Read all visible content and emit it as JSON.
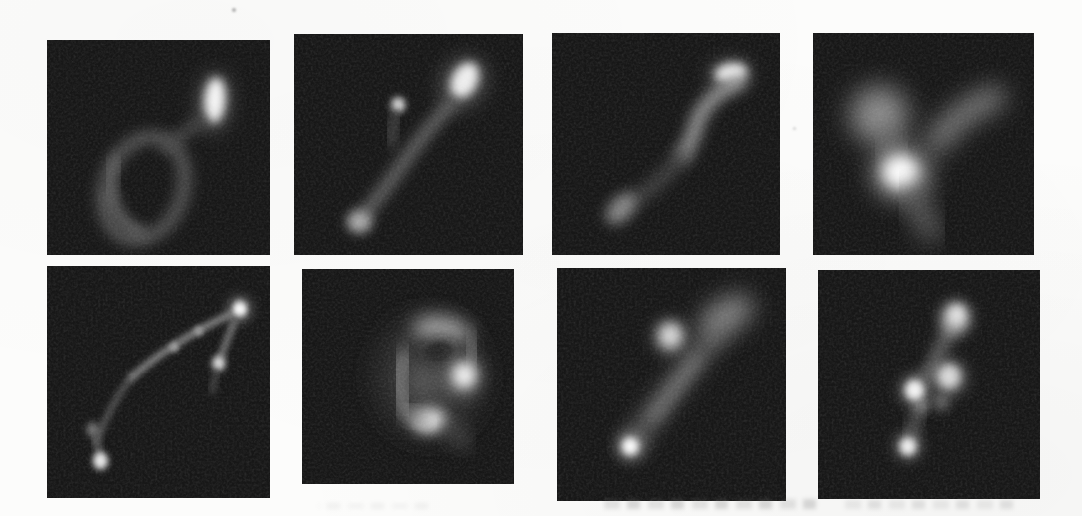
{
  "page": {
    "background": "#fcfcfb",
    "tile_background": "#171717"
  },
  "figure": {
    "name": "fluorescence-micrograph-grid",
    "rows": 2,
    "columns": 4,
    "tiles": [
      {
        "name": "micrograph-r1c1",
        "desc": "dim open loop lower left with bright vertical spot at upper right",
        "shapes": [
          {
            "kind": "blob",
            "cx": 75,
            "cy": 29,
            "rx": 7,
            "ry": 14,
            "rot": 4,
            "fill": "#7d7d7d",
            "blur": 4.5,
            "opacity": 0.6
          },
          {
            "kind": "blob",
            "cx": 75.3,
            "cy": 28,
            "rx": 4.6,
            "ry": 10.5,
            "rot": 4,
            "fill": "#f4f4f4",
            "blur": 2.2
          },
          {
            "kind": "ring",
            "cx": 43.5,
            "cy": 69,
            "rx": 17.5,
            "ry": 24.5,
            "rot": 18,
            "stroke": "#595959",
            "w": 5.5,
            "blur": 3
          },
          {
            "kind": "stroke",
            "d": "M 29,72 C 30,80 35,87 42,89",
            "stroke": "#6e6e6e",
            "w": 5,
            "blur": 2.8,
            "opacity": 0.9
          },
          {
            "kind": "stroke",
            "d": "M 31,56 C 29,61 28,66 28.5,71",
            "stroke": "#676767",
            "w": 5,
            "blur": 2.8,
            "opacity": 0.85
          },
          {
            "kind": "stroke",
            "d": "M 53,50 C 58,46 63,42 69.5,37.5",
            "stroke": "#4e4e4e",
            "w": 4.5,
            "blur": 3
          }
        ]
      },
      {
        "name": "micrograph-r1c2",
        "desc": "forked filament with bright blob top right, small dot upper middle, dim blob bottom left",
        "shapes": [
          {
            "kind": "blob",
            "cx": 74,
            "cy": 22,
            "rx": 9.5,
            "ry": 12,
            "rot": 25,
            "fill": "#757575",
            "blur": 4.5,
            "opacity": 0.6
          },
          {
            "kind": "blob",
            "cx": 74.5,
            "cy": 21,
            "rx": 5.5,
            "ry": 8.5,
            "rot": 25,
            "fill": "#ededed",
            "blur": 2.2
          },
          {
            "kind": "stroke",
            "d": "M 69,31 C 61,40 54,49 48,58 C 43,65.5 36.5,74.5 30,82.5",
            "stroke": "#6c6c6c",
            "w": 5,
            "blur": 3
          },
          {
            "kind": "blob",
            "cx": 45.5,
            "cy": 32,
            "rx": 3,
            "ry": 3.4,
            "fill": "#e2e2e2",
            "blur": 1.6
          },
          {
            "kind": "stroke",
            "d": "M 44.5,36 C 43.5,40.5 42.8,45 42.3,49.5",
            "stroke": "#4e4e4e",
            "w": 3.6,
            "blur": 2.6
          },
          {
            "kind": "blob",
            "cx": 28.5,
            "cy": 85,
            "rx": 5.4,
            "ry": 5,
            "fill": "#ababab",
            "blur": 2.4
          }
        ]
      },
      {
        "name": "micrograph-r1c3",
        "desc": "s-shaped curve with bright tip top right fading to dim blob lower left",
        "shapes": [
          {
            "kind": "blob",
            "cx": 78,
            "cy": 18.5,
            "rx": 9.5,
            "ry": 6.5,
            "rot": -10,
            "fill": "#7a7a7a",
            "blur": 4,
            "opacity": 0.6
          },
          {
            "kind": "blob",
            "cx": 78.5,
            "cy": 18,
            "rx": 7,
            "ry": 4.3,
            "rot": -10,
            "fill": "#efefef",
            "blur": 2.2
          },
          {
            "kind": "stroke",
            "d": "M 82,22 C 73,26 67,32 64,39 C 62.5,45 60.5,50 57.5,55",
            "stroke": "#979797",
            "w": 6.2,
            "blur": 3
          },
          {
            "kind": "stroke",
            "d": "M 57.5,55 C 52,62 45,69 38,74",
            "stroke": "#4b4b4b",
            "w": 5.2,
            "blur": 3.4
          },
          {
            "kind": "blob",
            "cx": 30.5,
            "cy": 79,
            "rx": 5,
            "ry": 8.5,
            "rot": 42,
            "fill": "#878787",
            "blur": 2.8
          }
        ]
      },
      {
        "name": "micrograph-r1c4",
        "desc": "large blurry crossing limbs with bright core left of center",
        "shapes": [
          {
            "kind": "blob",
            "cx": 30,
            "cy": 37,
            "rx": 13,
            "ry": 13,
            "rot": 0,
            "fill": "#8c8c8c",
            "blur": 6
          },
          {
            "kind": "stroke",
            "d": "M 82,29 C 72,33 63,39 56,49",
            "stroke": "#7f7f7f",
            "w": 10,
            "blur": 5.5
          },
          {
            "kind": "stroke",
            "d": "M 32.5,46 C 34.5,50.5 36.5,55 38.5,58.5",
            "stroke": "#6d6d6d",
            "w": 8,
            "blur": 5.5,
            "opacity": 0.85
          },
          {
            "kind": "blob",
            "cx": 40,
            "cy": 63,
            "rx": 13,
            "ry": 12,
            "rot": 0,
            "fill": "#969696",
            "blur": 5.5
          },
          {
            "kind": "blob",
            "cx": 39.5,
            "cy": 62.5,
            "rx": 7.5,
            "ry": 7,
            "rot": 0,
            "fill": "#fbfbfb",
            "blur": 3.2
          },
          {
            "kind": "stroke",
            "d": "M 45,73 C 48,79 51,85 53.5,90",
            "stroke": "#696969",
            "w": 8,
            "blur": 5.5
          }
        ]
      },
      {
        "name": "micrograph-r2c1",
        "desc": "thin beaded filament arcing from bright dot bottom left to bright dot top right with short side branch",
        "shapes": [
          {
            "kind": "stroke",
            "d": "M 22,76 C 26,66 31,56 38,48",
            "stroke": "#585858",
            "w": 2.6,
            "blur": 1.5
          },
          {
            "kind": "stroke",
            "d": "M 38,48 C 50,38 66,28 83,20.5",
            "stroke": "#8a8a8a",
            "w": 2.8,
            "blur": 1.4
          },
          {
            "kind": "blob",
            "cx": 57,
            "cy": 35,
            "rx": 2,
            "ry": 2,
            "rot": 0,
            "fill": "#a0a0a0",
            "blur": 1.1
          },
          {
            "kind": "blob",
            "cx": 68,
            "cy": 28,
            "rx": 2,
            "ry": 2,
            "rot": 0,
            "fill": "#9a9a9a",
            "blur": 1.1
          },
          {
            "kind": "blob",
            "cx": 86.5,
            "cy": 18.5,
            "rx": 5.5,
            "ry": 5.5,
            "rot": 0,
            "fill": "#848484",
            "blur": 2.6,
            "opacity": 0.7
          },
          {
            "kind": "blob",
            "cx": 86.5,
            "cy": 18.5,
            "rx": 3.2,
            "ry": 3.2,
            "rot": 0,
            "fill": "#f8f8f8",
            "blur": 1.3
          },
          {
            "kind": "stroke",
            "d": "M 84,24 C 81.5,30 79.5,35 78,39",
            "stroke": "#7a7a7a",
            "w": 2.8,
            "blur": 1.4
          },
          {
            "kind": "blob",
            "cx": 77,
            "cy": 42,
            "rx": 3,
            "ry": 3.3,
            "rot": 0,
            "fill": "#dadada",
            "blur": 1.4
          },
          {
            "kind": "stroke",
            "d": "M 76,46 C 75.2,49 74.5,51.5 74,54",
            "stroke": "#4c4c4c",
            "w": 2.5,
            "blur": 1.7
          },
          {
            "kind": "blob",
            "cx": 20.5,
            "cy": 70.5,
            "rx": 2.7,
            "ry": 3,
            "rot": 0,
            "fill": "#7d7d7d",
            "blur": 1.6
          },
          {
            "kind": "stroke",
            "d": "M 21.5,73.5 C 22.5,77 23.3,80 24,82.5",
            "stroke": "#5c5c5c",
            "w": 2.7,
            "blur": 1.5
          },
          {
            "kind": "blob",
            "cx": 24,
            "cy": 84,
            "rx": 3.4,
            "ry": 3.8,
            "rot": 0,
            "fill": "#e6e6e6",
            "blur": 1.4
          }
        ]
      },
      {
        "name": "micrograph-r2c2",
        "desc": "ring-shaped blob with dark center notch, bright spot right and bright bottom arc",
        "shapes": [
          {
            "kind": "blob",
            "cx": 60,
            "cy": 50,
            "rx": 24,
            "ry": 27,
            "rot": 0,
            "fill": "#353535",
            "blur": 7
          },
          {
            "kind": "blob",
            "cx": 66,
            "cy": 28.5,
            "rx": 13.5,
            "ry": 6.5,
            "rot": 8,
            "fill": "#9b9b9b",
            "blur": 4.2
          },
          {
            "kind": "stroke",
            "d": "M 79,32 C 81,37 81.5,41 80,45",
            "stroke": "#787878",
            "w": 6,
            "blur": 4,
            "opacity": 0.9
          },
          {
            "kind": "blob",
            "cx": 64.5,
            "cy": 38.5,
            "rx": 8,
            "ry": 5.5,
            "rot": -12,
            "fill": "#191919",
            "blur": 3.8
          },
          {
            "kind": "stroke",
            "d": "M 48.5,41 C 45.5,48 45.5,57 48.5,63.5",
            "stroke": "#8d8d8d",
            "w": 7,
            "blur": 4
          },
          {
            "kind": "blob",
            "cx": 58,
            "cy": 52,
            "rx": 8.5,
            "ry": 9,
            "rot": 0,
            "fill": "#565656",
            "blur": 5,
            "opacity": 0.95
          },
          {
            "kind": "blob",
            "cx": 76,
            "cy": 49.5,
            "rx": 8,
            "ry": 9,
            "rot": 0,
            "fill": "#909090",
            "blur": 4.2,
            "opacity": 0.85
          },
          {
            "kind": "blob",
            "cx": 76.5,
            "cy": 49.5,
            "rx": 5,
            "ry": 5.5,
            "rot": 0,
            "fill": "#f1f1f1",
            "blur": 2.8
          },
          {
            "kind": "blob",
            "cx": 60,
            "cy": 70.5,
            "rx": 8,
            "ry": 5.5,
            "rot": -6,
            "fill": "#e7e7e7",
            "blur": 3
          },
          {
            "kind": "stroke",
            "d": "M 69,73 C 72.5,76 75,79 76.5,81.5",
            "stroke": "#565656",
            "w": 6,
            "blur": 4.5,
            "opacity": 0.85
          },
          {
            "kind": "stroke",
            "d": "M 50,66 C 52.5,69 55.5,70.5 58,71",
            "stroke": "#8a8a8a",
            "w": 6,
            "blur": 3.5,
            "opacity": 0.9
          }
        ]
      },
      {
        "name": "micrograph-r2c3",
        "desc": "diffuse diagonal streak from bright dot bottom left to diffuse blob top right with bright knob upper middle",
        "shapes": [
          {
            "kind": "stroke",
            "d": "M 33,75 C 41,64 50,52 59,41 C 63,36 67,31 70,28",
            "stroke": "#5e5e5e",
            "w": 8.5,
            "blur": 4.5
          },
          {
            "kind": "blob",
            "cx": 74,
            "cy": 20.5,
            "rx": 13,
            "ry": 7,
            "rot": -30,
            "fill": "#848484",
            "blur": 5
          },
          {
            "kind": "stroke",
            "d": "M 42,64 C 49,55 55,47 61,39",
            "stroke": "#757575",
            "w": 4.5,
            "blur": 3,
            "opacity": 0.9
          },
          {
            "kind": "blob",
            "cx": 49.5,
            "cy": 29.5,
            "rx": 7.5,
            "ry": 7.5,
            "rot": 0,
            "fill": "#7e7e7e",
            "blur": 3.5,
            "opacity": 0.8
          },
          {
            "kind": "blob",
            "cx": 49.5,
            "cy": 29,
            "rx": 4.8,
            "ry": 5,
            "rot": 0,
            "fill": "#d6d6d6",
            "blur": 2.4
          },
          {
            "kind": "blob",
            "cx": 32,
            "cy": 76.5,
            "rx": 6,
            "ry": 6,
            "rot": 0,
            "fill": "#8a8a8a",
            "blur": 3,
            "opacity": 0.8
          },
          {
            "kind": "blob",
            "cx": 32,
            "cy": 76.5,
            "rx": 3.6,
            "ry": 3.8,
            "rot": 0,
            "fill": "#fafafa",
            "blur": 1.6
          }
        ]
      },
      {
        "name": "micrograph-r2c4",
        "desc": "diagonal chain of bright beads from bottom left to top right",
        "shapes": [
          {
            "kind": "stroke",
            "d": "M 61,24 C 58,29 55,34 53,39 C 52,41.5 51.5,43.5 51,45.5",
            "stroke": "#6e6e6e",
            "w": 5,
            "blur": 3
          },
          {
            "kind": "stroke",
            "d": "M 45,50 C 47,47.5 49,45.5 51,44",
            "stroke": "#606060",
            "w": 4.5,
            "blur": 3,
            "opacity": 0.9
          },
          {
            "kind": "stroke",
            "d": "M 41,75 C 42.5,70 44,65.5 45.5,61",
            "stroke": "#636363",
            "w": 4,
            "blur": 2.8
          },
          {
            "kind": "blob",
            "cx": 46.5,
            "cy": 59,
            "rx": 3.4,
            "ry": 3.6,
            "rot": 0,
            "fill": "#7a7a7a",
            "blur": 2.2
          },
          {
            "kind": "blob",
            "cx": 55.5,
            "cy": 57.5,
            "rx": 3.6,
            "ry": 3.8,
            "rot": 0,
            "fill": "#6f6f6f",
            "blur": 2.5
          },
          {
            "kind": "blob",
            "cx": 40.5,
            "cy": 77,
            "rx": 6,
            "ry": 6,
            "rot": 0,
            "fill": "#777777",
            "blur": 3,
            "opacity": 0.8
          },
          {
            "kind": "blob",
            "cx": 40.5,
            "cy": 77,
            "rx": 3.7,
            "ry": 3.9,
            "rot": 0,
            "fill": "#ededed",
            "blur": 1.6
          },
          {
            "kind": "blob",
            "cx": 43.5,
            "cy": 52.5,
            "rx": 6.5,
            "ry": 6.5,
            "rot": 0,
            "fill": "#808080",
            "blur": 3,
            "opacity": 0.85
          },
          {
            "kind": "blob",
            "cx": 43.5,
            "cy": 52.5,
            "rx": 4.2,
            "ry": 4.4,
            "rot": 0,
            "fill": "#f2f2f2",
            "blur": 1.7
          },
          {
            "kind": "blob",
            "cx": 59,
            "cy": 47,
            "rx": 7.5,
            "ry": 7.5,
            "rot": 0,
            "fill": "#7c7c7c",
            "blur": 3.5,
            "opacity": 0.85
          },
          {
            "kind": "blob",
            "cx": 59,
            "cy": 46.5,
            "rx": 5,
            "ry": 5.2,
            "rot": 0,
            "fill": "#d9d9d9",
            "blur": 2.2
          },
          {
            "kind": "blob",
            "cx": 62,
            "cy": 21,
            "rx": 6.5,
            "ry": 7,
            "rot": 15,
            "fill": "#b9b9b9",
            "blur": 3
          },
          {
            "kind": "blob",
            "cx": 62.5,
            "cy": 19.5,
            "rx": 3.5,
            "ry": 3.8,
            "rot": 0,
            "fill": "#e2e2e2",
            "blur": 2
          }
        ]
      }
    ]
  },
  "artifacts": {
    "bleed_marks": [
      {
        "left": 602,
        "top": 499,
        "width": 214,
        "height": 10,
        "opacity": 0.5
      },
      {
        "left": 845,
        "top": 500,
        "width": 168,
        "height": 9,
        "opacity": 0.35
      },
      {
        "left": 318,
        "top": 503,
        "width": 110,
        "height": 6,
        "opacity": 0.16
      }
    ],
    "specks": [
      {
        "left": 232,
        "top": 8,
        "size": 4,
        "color": "#8f8f8f",
        "opacity": 0.7
      },
      {
        "left": 793,
        "top": 127,
        "size": 3,
        "color": "#b5b5b5",
        "opacity": 0.6
      }
    ]
  }
}
